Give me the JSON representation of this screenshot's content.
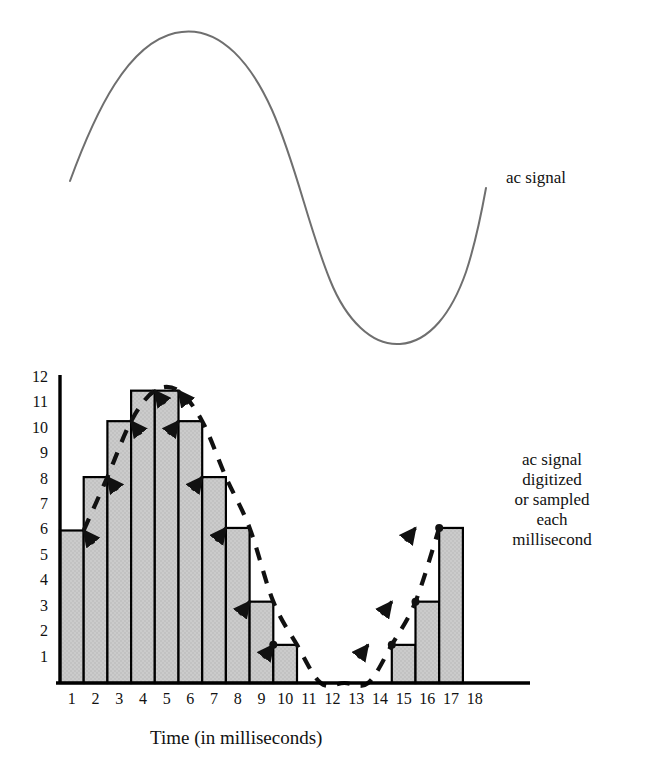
{
  "figure": {
    "background": "#ffffff",
    "wave_color": "#6f6f6f",
    "bar_fill": "#c9c9c9",
    "bar_stroke": "#000000",
    "envelope_color": "#111111",
    "text_color": "#111111"
  },
  "annotations": {
    "ac_signal": "ac signal",
    "digitized_lines": [
      "ac signal",
      "digitized",
      "or sampled",
      "each",
      "millisecond"
    ]
  },
  "chart_data": {
    "type": "bar",
    "title": "",
    "subtitle": "",
    "xlabel": "Time (in milliseconds)",
    "ylabel": "",
    "grid": false,
    "legend_position": "right",
    "xlim": [
      1,
      18
    ],
    "ylim": [
      0,
      12
    ],
    "categories": [
      "1",
      "2",
      "3",
      "4",
      "5",
      "6",
      "7",
      "8",
      "9",
      "10",
      "11",
      "12",
      "13",
      "14",
      "15",
      "16",
      "17",
      "18"
    ],
    "xticks": [
      "1",
      "2",
      "3",
      "4",
      "5",
      "6",
      "7",
      "8",
      "9",
      "10",
      "11",
      "12",
      "13",
      "14",
      "15",
      "16",
      "17",
      "18"
    ],
    "yticks": [
      "1",
      "2",
      "3",
      "4",
      "5",
      "6",
      "7",
      "8",
      "9",
      "10",
      "11",
      "12"
    ],
    "series": [
      {
        "name": "ac signal digitized or sampled each millisecond",
        "values": [
          6.0,
          8.1,
          10.3,
          11.5,
          11.5,
          10.3,
          8.1,
          6.1,
          3.2,
          1.5,
          0,
          0,
          0,
          0,
          1.5,
          3.2,
          6.1,
          0
        ]
      }
    ],
    "envelope": {
      "name": "ac signal",
      "style": "dashed",
      "marker": "arrow",
      "points": [
        {
          "x": 1,
          "y": 6.0
        },
        {
          "x": 2,
          "y": 8.1
        },
        {
          "x": 3,
          "y": 10.3
        },
        {
          "x": 4,
          "y": 11.5
        },
        {
          "x": 5,
          "y": 11.5
        },
        {
          "x": 6,
          "y": 10.3
        },
        {
          "x": 7,
          "y": 8.1
        },
        {
          "x": 8,
          "y": 6.1
        },
        {
          "x": 9,
          "y": 3.2
        },
        {
          "x": 10,
          "y": 1.5
        },
        {
          "x": 11,
          "y": 0
        },
        {
          "x": 12,
          "y": 0
        },
        {
          "x": 13,
          "y": 0
        },
        {
          "x": 14,
          "y": 1.5
        },
        {
          "x": 15,
          "y": 3.2
        },
        {
          "x": 16,
          "y": 6.1
        }
      ]
    },
    "wave": {
      "name": "ac signal",
      "type": "line",
      "description": "smooth sinusoidal ac waveform, one cycle"
    }
  }
}
